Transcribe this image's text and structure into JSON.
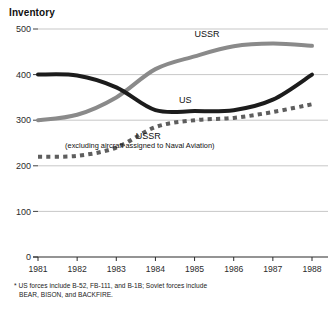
{
  "figure": {
    "title": "Inventory",
    "footnote_marker": "*",
    "footnote_line1": "US forces include B-52, FB-111, and B-1B; Soviet forces include",
    "footnote_line2": "BEAR, BISON, and BACKFIRE."
  },
  "labels": {
    "ussr_top": "USSR",
    "us": "US",
    "ussr_naval_main": "USSR",
    "ussr_naval_sub": "(excluding aircraft assigned to Naval Aviation)"
  },
  "colors": {
    "us_line": "#1c1c1c",
    "ussr_line": "#8a8a8a",
    "ussr_naval_line": "#5e5e5e",
    "gridline": "#b9b9b9",
    "axis": "#2b2b2b",
    "text": "#1a1a1a",
    "background": "#ffffff"
  },
  "chart_data": {
    "type": "line",
    "title": "Inventory",
    "xlabel": "",
    "ylabel": "",
    "x": [
      1981,
      1982,
      1983,
      1984,
      1985,
      1986,
      1987,
      1988
    ],
    "xtick_labels": [
      "1981",
      "1982",
      "1983",
      "1984",
      "1985",
      "1986",
      "1987",
      "1988"
    ],
    "ytick_labels": [
      "0",
      "100",
      "200",
      "300",
      "400",
      "500"
    ],
    "yticks": [
      0,
      100,
      200,
      300,
      400,
      500
    ],
    "ylim": [
      0,
      500
    ],
    "xlim": [
      1981,
      1988
    ],
    "grid": true,
    "legend": "inline-annotations",
    "series": [
      {
        "name": "US",
        "style": "solid",
        "color": "#1c1c1c",
        "width": 4,
        "values": [
          400,
          398,
          372,
          322,
          320,
          322,
          345,
          400
        ]
      },
      {
        "name": "USSR",
        "style": "solid",
        "color": "#8a8a8a",
        "width": 4,
        "values": [
          300,
          312,
          350,
          412,
          440,
          462,
          468,
          463
        ]
      },
      {
        "name": "USSR (excluding aircraft assigned to Naval Aviation)",
        "style": "dashed",
        "color": "#5e5e5e",
        "width": 4,
        "values": [
          220,
          222,
          240,
          285,
          300,
          305,
          318,
          335
        ]
      }
    ],
    "annotations": [
      {
        "text": "USSR",
        "series": "USSR",
        "x": 1985.0,
        "y": 482
      },
      {
        "text": "US",
        "series": "US",
        "x": 1984.6,
        "y": 338
      },
      {
        "text": "USSR",
        "series": "USSR (excluding aircraft assigned to Naval Aviation)",
        "x": 1983.5,
        "y": 258
      },
      {
        "text": "(excluding aircraft assigned to Naval Aviation)",
        "series": "USSR (excluding aircraft assigned to Naval Aviation)",
        "x": 1983.6,
        "y": 240
      }
    ]
  }
}
